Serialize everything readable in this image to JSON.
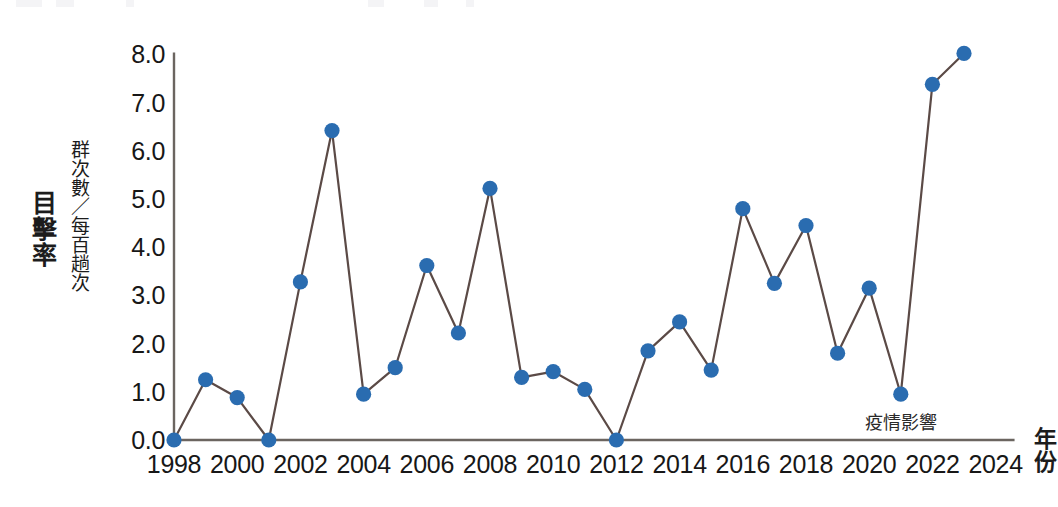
{
  "chart_data": {
    "type": "line",
    "title": "",
    "subtitle": "",
    "xlabel": "年份",
    "ylabel": "目擊率",
    "ylabel_unit": "群次數／每百趟次",
    "grid": false,
    "legend": "none",
    "marker": "circle",
    "marker_color": "#2a6cb0",
    "line_color": "#5b4a46",
    "axis_color": "#6b6560",
    "xlim": [
      1997,
      2024.6
    ],
    "ylim": [
      0.0,
      8.0
    ],
    "yticks": [
      "0.0",
      "1.0",
      "2.0",
      "3.0",
      "4.0",
      "5.0",
      "6.0",
      "7.0",
      "8.0"
    ],
    "ytick_values": [
      0,
      1,
      2,
      3,
      4,
      5,
      6,
      7,
      8
    ],
    "xticks": [
      "1998",
      "2000",
      "2002",
      "2004",
      "2006",
      "2008",
      "2010",
      "2012",
      "2014",
      "2016",
      "2018",
      "2020",
      "2022",
      "2024"
    ],
    "xtick_values": [
      1998,
      2000,
      2002,
      2004,
      2006,
      2008,
      2010,
      2012,
      2014,
      2016,
      2018,
      2020,
      2022,
      2024
    ],
    "x": [
      1998,
      1999,
      2000,
      2001,
      2002,
      2003,
      2004,
      2005,
      2006,
      2007,
      2008,
      2009,
      2010,
      2011,
      2012,
      2013,
      2014,
      2015,
      2016,
      2017,
      2018,
      2019,
      2020,
      2021,
      2022,
      2023
    ],
    "values": [
      0.0,
      1.25,
      0.88,
      0.0,
      3.28,
      6.42,
      0.95,
      1.5,
      3.62,
      2.22,
      5.22,
      1.3,
      1.42,
      1.05,
      0.0,
      1.85,
      2.45,
      1.45,
      4.8,
      3.25,
      4.45,
      1.8,
      3.15,
      0.95,
      7.38,
      8.02
    ],
    "annotations": [
      {
        "text": "疫情影響",
        "x": 2021,
        "y": 0.95
      }
    ]
  }
}
